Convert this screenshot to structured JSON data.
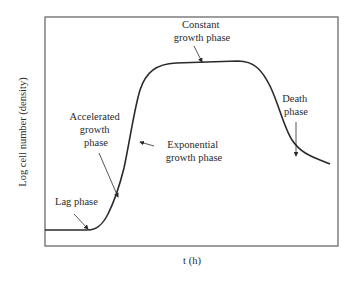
{
  "diagram": {
    "type": "line",
    "title": "",
    "xlabel": "t (h)",
    "ylabel": "Log cell number (density)",
    "frame_color": "#6a6a6a",
    "curve_color": "#2a2a2a",
    "annotations": [
      {
        "id": "lag",
        "lines": [
          "Lag phase"
        ]
      },
      {
        "id": "accelerated",
        "lines": [
          "Accelerated",
          "growth",
          "phase"
        ]
      },
      {
        "id": "exponential",
        "lines": [
          "Exponential",
          "growth phase"
        ]
      },
      {
        "id": "constant",
        "lines": [
          "Constant",
          "growth phase"
        ]
      },
      {
        "id": "death",
        "lines": [
          "Death",
          "phase"
        ]
      }
    ]
  }
}
